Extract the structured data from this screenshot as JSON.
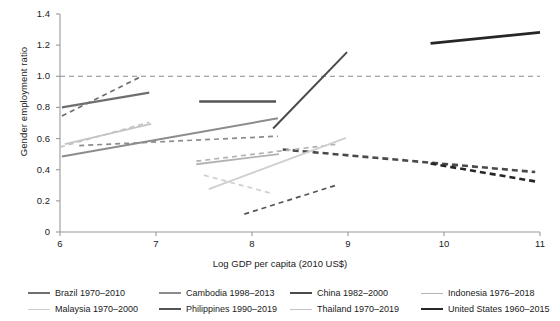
{
  "chart_data": {
    "type": "line",
    "title": "",
    "xlabel": "Log GDP per capita (2010 US$)",
    "ylabel": "Gender employment ratio",
    "xlim": [
      6,
      11
    ],
    "ylim": [
      0,
      1.4
    ],
    "xticks": [
      "6",
      "7",
      "8",
      "9",
      "10",
      "11"
    ],
    "yticks": [
      "0",
      "0.2",
      "0.4",
      "0.6",
      "0.8",
      "1.0",
      "1.2",
      "1.4"
    ],
    "grid": false,
    "legend_position": "bottom",
    "reference_line": {
      "y": 1.0,
      "style": "dashed",
      "color": "#8a8a8a"
    },
    "series": [
      {
        "name": "Brazil 1970–2010",
        "color": "#6f6f6f",
        "solid": {
          "x": [
            6.02,
            6.93
          ],
          "y": [
            0.8,
            0.895
          ]
        },
        "dashed": {
          "x": [
            6.02,
            6.85
          ],
          "y": [
            0.745,
            1.0
          ]
        }
      },
      {
        "name": "Cambodia 1998–2013",
        "color": "#8c8c8c",
        "solid": {
          "x": [
            6.02,
            8.27
          ],
          "y": [
            0.485,
            0.73
          ]
        },
        "dashed": {
          "x": [
            6.2,
            8.27
          ],
          "y": [
            0.555,
            0.615
          ]
        }
      },
      {
        "name": "China 1982–2000",
        "color": "#4a4a4a",
        "solid": {
          "x": [
            8.22,
            8.99
          ],
          "y": [
            0.665,
            1.155
          ]
        },
        "dashed": {
          "x": [
            8.32,
            10.95
          ],
          "y": [
            0.53,
            0.385
          ]
        }
      },
      {
        "name": "Indonesia 1976–2018",
        "color": "#b3b3b3",
        "solid": {
          "x": [
            7.42,
            8.28
          ],
          "y": [
            0.435,
            0.5
          ]
        },
        "dashed": {
          "x": [
            7.42,
            8.9
          ],
          "y": [
            0.455,
            0.565
          ]
        }
      },
      {
        "name": "Malaysia 1970–2000",
        "color": "#cfcfcf",
        "solid": {
          "x": [
            7.55,
            8.98
          ],
          "y": [
            0.275,
            0.605
          ]
        },
        "dashed": {
          "x": [
            7.5,
            8.22
          ],
          "y": [
            0.365,
            0.245
          ]
        }
      },
      {
        "name": "Philippines 1990–2019",
        "color": "#545454",
        "solid": {
          "x": [
            7.45,
            8.25
          ],
          "y": [
            0.838,
            0.838
          ]
        },
        "dashed": {
          "x": [
            7.92,
            8.9
          ],
          "y": [
            0.115,
            0.305
          ]
        }
      },
      {
        "name": "Thailand 1970–2019",
        "color": "#c4c4c4",
        "solid": {
          "x": [
            6.05,
            6.95
          ],
          "y": [
            0.565,
            0.695
          ]
        },
        "dashed": {
          "x": [
            6.0,
            6.93
          ],
          "y": [
            0.545,
            0.705
          ]
        }
      },
      {
        "name": "United States 1960–2015",
        "color": "#262626",
        "solid": {
          "x": [
            9.86,
            11.0
          ],
          "y": [
            1.212,
            1.282
          ]
        },
        "dashed": {
          "x": [
            9.86,
            10.95
          ],
          "y": [
            0.44,
            0.325
          ]
        }
      }
    ]
  },
  "axis": {
    "y_title": "Gender employment ratio",
    "x_title": "Log GDP per capita (2010 US$)",
    "y_ticks": [
      "1.4",
      "1.2",
      "1.0",
      "0.8",
      "0.6",
      "0.4",
      "0.2",
      "0"
    ],
    "x_ticks": [
      "6",
      "7",
      "8",
      "9",
      "10",
      "11"
    ]
  },
  "legend": {
    "items": [
      {
        "label": "Brazil 1970–2010",
        "color": "#6f6f6f",
        "weight": "2.2px"
      },
      {
        "label": "Cambodia 1998–2013",
        "color": "#8c8c8c",
        "weight": "2px"
      },
      {
        "label": "China 1982–2000",
        "color": "#4a4a4a",
        "weight": "2px"
      },
      {
        "label": "Indonesia 1976–2018",
        "color": "#b3b3b3",
        "weight": "1.8px"
      },
      {
        "label": "Malaysia 1970–2000",
        "color": "#cfcfcf",
        "weight": "1.8px"
      },
      {
        "label": "Philippines 1990–2019",
        "color": "#545454",
        "weight": "2.4px"
      },
      {
        "label": "Thailand 1970–2019",
        "color": "#c4c4c4",
        "weight": "1.8px"
      },
      {
        "label": "United States 1960–2015",
        "color": "#262626",
        "weight": "2.8px"
      }
    ]
  }
}
